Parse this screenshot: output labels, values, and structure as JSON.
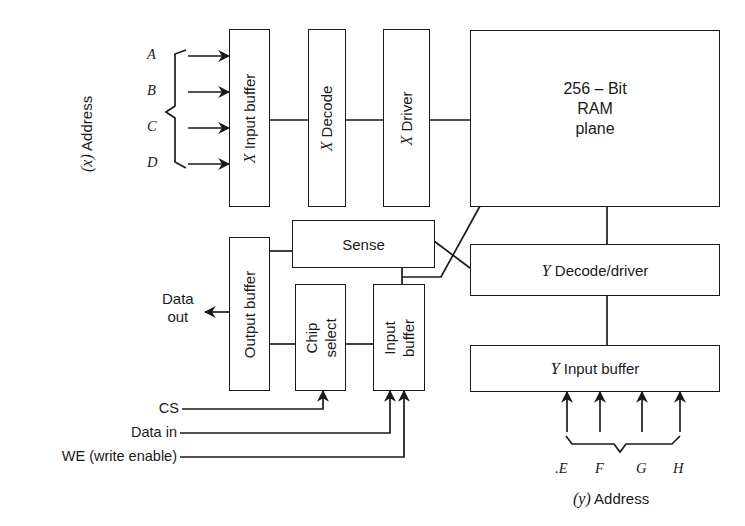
{
  "diagram": {
    "x_address": {
      "label_prefix": "(x)",
      "label": "Address",
      "inputs": [
        "A",
        "B",
        "C",
        "D"
      ]
    },
    "y_address": {
      "label_prefix": "(y)",
      "label": "Address",
      "inputs": [
        ".E",
        "F",
        "G",
        "H"
      ]
    },
    "blocks": {
      "x_input_buffer": {
        "prefix": "X",
        "label": "Input buffer"
      },
      "x_decode": {
        "prefix": "X",
        "label": "Decode"
      },
      "x_driver": {
        "prefix": "X",
        "label": "Driver"
      },
      "ram_plane": {
        "line1": "256 – Bit",
        "line2": "RAM",
        "line3": "plane"
      },
      "sense": {
        "label": "Sense"
      },
      "output_buffer": {
        "label": "Output buffer"
      },
      "chip_select": {
        "line1": "Chip",
        "line2": "select"
      },
      "input_buffer": {
        "line1": "Input",
        "line2": "buffer"
      },
      "y_decode_driver": {
        "prefix": "Y",
        "label": "Decode/driver"
      },
      "y_input_buffer": {
        "prefix": "Y",
        "label": "Input buffer"
      }
    },
    "signals": {
      "data_out_line1": "Data",
      "data_out_line2": "out",
      "cs": "CS",
      "data_in": "Data in",
      "we": "WE (write enable)"
    },
    "colors": {
      "line": "#1a1a1a",
      "background": "#ffffff"
    }
  }
}
